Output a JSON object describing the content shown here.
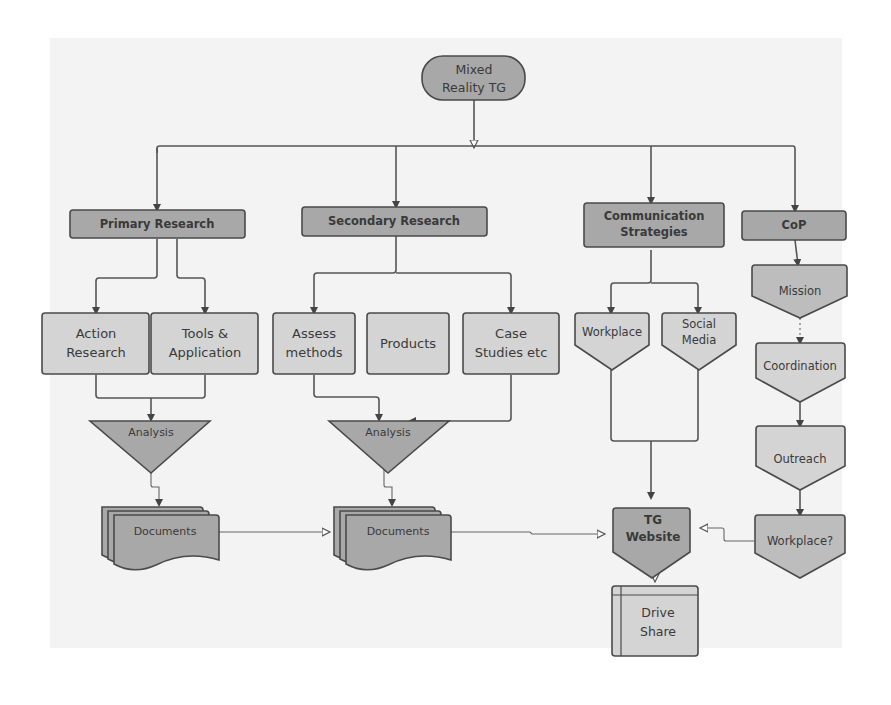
{
  "diagram": {
    "root": {
      "label_line1": "Mixed",
      "label_line2": "Reality TG"
    },
    "categories": [
      {
        "id": "primary",
        "label": "Primary Research"
      },
      {
        "id": "secondary",
        "label": "Secondary Research"
      },
      {
        "id": "communication",
        "label_line1": "Communication",
        "label_line2": "Strategies"
      },
      {
        "id": "cop",
        "label": "CoP"
      }
    ],
    "primary_children": [
      {
        "label_line1": "Action",
        "label_line2": "Research"
      },
      {
        "label_line1": "Tools &",
        "label_line2": "Application"
      }
    ],
    "secondary_children": [
      {
        "label_line1": "Assess",
        "label_line2": "methods"
      },
      {
        "label": "Products"
      },
      {
        "label_line1": "Case",
        "label_line2": "Studies etc"
      }
    ],
    "communication_children": [
      {
        "label": "Workplace"
      },
      {
        "label_line1": "Social",
        "label_line2": "Media"
      }
    ],
    "cop_chain": [
      {
        "label": "Mission"
      },
      {
        "label": "Coordination"
      },
      {
        "label": "Outreach"
      },
      {
        "label": "Workplace?"
      }
    ],
    "analysis": [
      {
        "label": "Analysis"
      },
      {
        "label": "Analysis"
      }
    ],
    "documents": [
      {
        "label": "Documents"
      },
      {
        "label": "Documents"
      }
    ],
    "website": {
      "label_line1": "TG",
      "label_line2": "Website"
    },
    "drive": {
      "label_line1": "Drive",
      "label_line2": "Share"
    }
  },
  "colors": {
    "dark_fill": "#a8a8a8",
    "light_fill": "#d4d4d4",
    "stroke": "#4a4a4a",
    "background_panel": "#f3f3f3"
  }
}
